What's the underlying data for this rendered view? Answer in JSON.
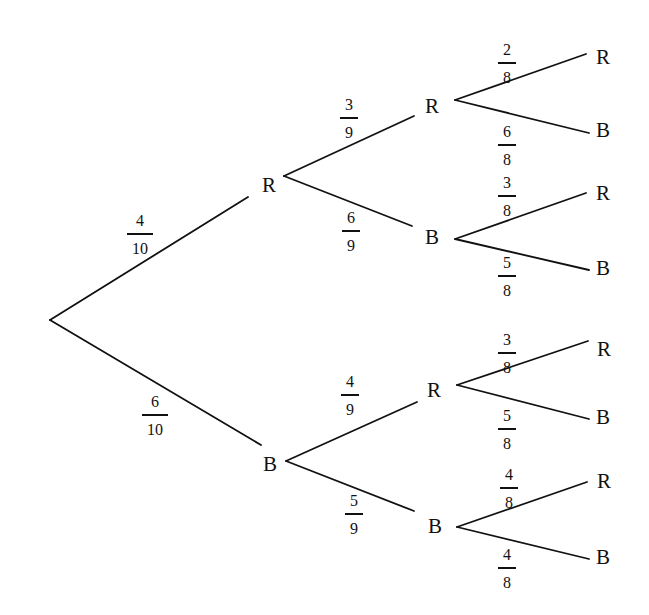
{
  "diagram": {
    "type": "probability-tree",
    "root": {
      "x": 50,
      "y": 320
    },
    "levels": 3,
    "nodes": [
      {
        "id": "L1-R",
        "label": "R",
        "x": 269,
        "y": 185
      },
      {
        "id": "L1-B",
        "label": "B",
        "x": 270,
        "y": 464
      },
      {
        "id": "L2-RR",
        "label": "R",
        "x": 432,
        "y": 106
      },
      {
        "id": "L2-RB",
        "label": "B",
        "x": 432,
        "y": 237
      },
      {
        "id": "L2-BR",
        "label": "R",
        "x": 434,
        "y": 390
      },
      {
        "id": "L2-BB",
        "label": "B",
        "x": 435,
        "y": 526
      },
      {
        "id": "L3-RRR",
        "label": "R",
        "x": 603,
        "y": 57
      },
      {
        "id": "L3-RRB",
        "label": "B",
        "x": 603,
        "y": 130
      },
      {
        "id": "L3-RBR",
        "label": "R",
        "x": 603,
        "y": 193
      },
      {
        "id": "L3-RBB",
        "label": "B",
        "x": 603,
        "y": 268
      },
      {
        "id": "L3-BRR",
        "label": "R",
        "x": 604,
        "y": 349
      },
      {
        "id": "L3-BRB",
        "label": "B",
        "x": 603,
        "y": 417
      },
      {
        "id": "L3-BBR",
        "label": "R",
        "x": 604,
        "y": 481
      },
      {
        "id": "L3-BBB",
        "label": "B",
        "x": 603,
        "y": 557
      }
    ],
    "branches": [
      {
        "from": "root",
        "to": "L1-R",
        "x1": 50,
        "y1": 320,
        "x2": 248,
        "y2": 197,
        "prob": {
          "num": "4",
          "den": "10",
          "x": 140,
          "y": 234
        }
      },
      {
        "from": "root",
        "to": "L1-B",
        "x1": 50,
        "y1": 320,
        "x2": 261,
        "y2": 445,
        "prob": {
          "num": "6",
          "den": "10",
          "x": 155,
          "y": 415
        }
      },
      {
        "from": "L1-R",
        "to": "L2-RR",
        "x1": 284,
        "y1": 176,
        "x2": 414,
        "y2": 116,
        "prob": {
          "num": "3",
          "den": "9",
          "x": 349,
          "y": 118
        }
      },
      {
        "from": "L1-R",
        "to": "L2-RB",
        "x1": 284,
        "y1": 176,
        "x2": 412,
        "y2": 226,
        "prob": {
          "num": "6",
          "den": "9",
          "x": 351,
          "y": 231
        }
      },
      {
        "from": "L1-B",
        "to": "L2-BR",
        "x1": 286,
        "y1": 461,
        "x2": 417,
        "y2": 402,
        "prob": {
          "num": "4",
          "den": "9",
          "x": 350,
          "y": 395
        }
      },
      {
        "from": "L1-B",
        "to": "L2-BB",
        "x1": 286,
        "y1": 461,
        "x2": 414,
        "y2": 511,
        "prob": {
          "num": "5",
          "den": "9",
          "x": 354,
          "y": 514
        }
      },
      {
        "from": "L2-RR",
        "to": "L3-RRR",
        "x1": 455,
        "y1": 100,
        "x2": 586,
        "y2": 54,
        "prob": {
          "num": "2",
          "den": "8",
          "x": 507,
          "y": 63
        }
      },
      {
        "from": "L2-RR",
        "to": "L3-RRB",
        "x1": 455,
        "y1": 100,
        "x2": 589,
        "y2": 133,
        "prob": {
          "num": "6",
          "den": "8",
          "x": 507,
          "y": 145
        }
      },
      {
        "from": "L2-RB",
        "to": "L3-RBR",
        "x1": 455,
        "y1": 239,
        "x2": 586,
        "y2": 193,
        "prob": {
          "num": "3",
          "den": "8",
          "x": 507,
          "y": 196
        }
      },
      {
        "from": "L2-RB",
        "to": "L3-RBB",
        "x1": 455,
        "y1": 239,
        "x2": 589,
        "y2": 270,
        "prob": {
          "num": "5",
          "den": "8",
          "x": 507,
          "y": 276
        }
      },
      {
        "from": "L2-BR",
        "to": "L3-BRR",
        "x1": 457,
        "y1": 385,
        "x2": 588,
        "y2": 341,
        "prob": {
          "num": "3",
          "den": "8",
          "x": 507,
          "y": 353
        }
      },
      {
        "from": "L2-BR",
        "to": "L3-BRB",
        "x1": 457,
        "y1": 385,
        "x2": 589,
        "y2": 419,
        "prob": {
          "num": "5",
          "den": "8",
          "x": 507,
          "y": 429
        }
      },
      {
        "from": "L2-BB",
        "to": "L3-BBR",
        "x1": 457,
        "y1": 527,
        "x2": 587,
        "y2": 482,
        "prob": {
          "num": "4",
          "den": "8",
          "x": 509,
          "y": 488
        }
      },
      {
        "from": "L2-BB",
        "to": "L3-BBB",
        "x1": 457,
        "y1": 527,
        "x2": 589,
        "y2": 559,
        "prob": {
          "num": "4",
          "den": "8",
          "x": 507,
          "y": 568
        }
      }
    ],
    "colors": {
      "ink": "#111111",
      "background": "#ffffff"
    }
  }
}
